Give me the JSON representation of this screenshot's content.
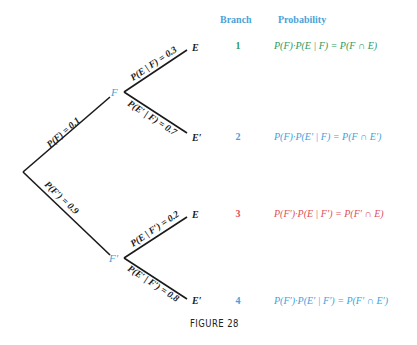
{
  "headers": {
    "branch": "Branch",
    "probability": "Probability"
  },
  "tree": {
    "root_to_F": "P(F) = 0.1",
    "root_to_Fp": "P(F′) = 0.9",
    "F_to_E": "P(E | F) = 0.3",
    "F_to_Ep": "P(E′ | F) = 0.7",
    "Fp_to_E": "P(E | F′) = 0.2",
    "Fp_to_Ep": "P(E′ | F′) = 0.8",
    "node_F": "F",
    "node_Fp": "F′",
    "leaf1": "E",
    "leaf2": "E′",
    "leaf3": "E",
    "leaf4": "E′"
  },
  "branches": [
    {
      "number": "1",
      "formula": "P(F)·P(E | F) = P(F ∩ E)",
      "color": "#2e9a5e"
    },
    {
      "number": "2",
      "formula": "P(F)·P(E′ | F) = P(F ∩ E′)",
      "color": "#3ea3dc"
    },
    {
      "number": "3",
      "formula": "P(F′)·P(E | F′) = P(F′ ∩ E)",
      "color": "#e0505a"
    },
    {
      "number": "4",
      "formula": "P(F′)·P(E′ | F′) = P(F′ ∩ E′)",
      "color": "#3ea3dc"
    }
  ],
  "caption": "FIGURE 28"
}
